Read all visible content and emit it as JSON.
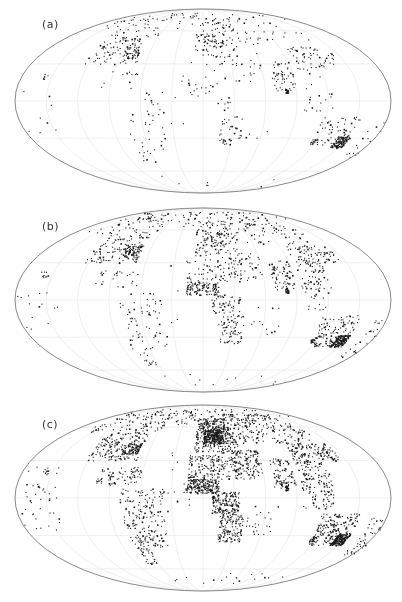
{
  "figure": {
    "projection": "Mollweide",
    "background": "#ffffff",
    "outline_color": "#8a8a8a",
    "graticule_color": "#e6e6e6",
    "dot_color": "#1a1a1a",
    "graticule": {
      "lon_step_deg": 30,
      "lat_step_deg": 30
    }
  },
  "panels": [
    {
      "label": "(a)",
      "top": 0,
      "height": 200,
      "center_x": 203,
      "center_y": 101,
      "rx": 188,
      "ry": 92,
      "label_x": 42,
      "label_y": 26,
      "density": 1.0
    },
    {
      "label": "(b)",
      "top": 200,
      "height": 200,
      "center_x": 203,
      "center_y": 100,
      "rx": 188,
      "ry": 92,
      "label_x": 42,
      "label_y": 28,
      "density": 1.6
    },
    {
      "label": "(c)",
      "top": 398,
      "height": 204,
      "center_x": 203,
      "center_y": 100,
      "rx": 188,
      "ry": 93,
      "label_x": 42,
      "label_y": 28,
      "density": 2.6
    }
  ],
  "station_regions": [
    {
      "name": "north-america",
      "lon": [
        -125,
        -70
      ],
      "lat": [
        30,
        55
      ],
      "a": 90,
      "b": 130,
      "c": 170
    },
    {
      "name": "canada-alaska",
      "lon": [
        -165,
        -60
      ],
      "lat": [
        55,
        75
      ],
      "a": 40,
      "b": 60,
      "c": 90
    },
    {
      "name": "us-east-dense",
      "lon": [
        -90,
        -72
      ],
      "lat": [
        35,
        45
      ],
      "a": 40,
      "b": 60,
      "c": 80
    },
    {
      "name": "central-america-caribbean",
      "lon": [
        -105,
        -62
      ],
      "lat": [
        10,
        25
      ],
      "a": 12,
      "b": 25,
      "c": 80
    },
    {
      "name": "south-america",
      "lon": [
        -80,
        -38
      ],
      "lat": [
        -40,
        8
      ],
      "a": 35,
      "b": 70,
      "c": 190
    },
    {
      "name": "south-america-south",
      "lon": [
        -75,
        -60
      ],
      "lat": [
        -55,
        -40
      ],
      "a": 10,
      "b": 15,
      "c": 30
    },
    {
      "name": "greenland-iceland",
      "lon": [
        -50,
        -15
      ],
      "lat": [
        62,
        80
      ],
      "a": 10,
      "b": 14,
      "c": 20
    },
    {
      "name": "europe",
      "lon": [
        -10,
        40
      ],
      "lat": [
        36,
        70
      ],
      "a": 80,
      "b": 110,
      "c": 320
    },
    {
      "name": "europe-core",
      "lon": [
        0,
        25
      ],
      "lat": [
        45,
        58
      ],
      "a": 20,
      "b": 30,
      "c": 260
    },
    {
      "name": "russia-north-asia",
      "lon": [
        40,
        140
      ],
      "lat": [
        45,
        75
      ],
      "a": 40,
      "b": 90,
      "c": 200
    },
    {
      "name": "middle-east",
      "lon": [
        30,
        60
      ],
      "lat": [
        15,
        40
      ],
      "a": 15,
      "b": 45,
      "c": 130
    },
    {
      "name": "north-africa",
      "lon": [
        -15,
        35
      ],
      "lat": [
        15,
        35
      ],
      "a": 12,
      "b": 60,
      "c": 160
    },
    {
      "name": "west-africa",
      "lon": [
        -17,
        15
      ],
      "lat": [
        4,
        15
      ],
      "a": 14,
      "b": 110,
      "c": 200
    },
    {
      "name": "central-africa",
      "lon": [
        8,
        35
      ],
      "lat": [
        -12,
        5
      ],
      "a": 10,
      "b": 50,
      "c": 170
    },
    {
      "name": "east-southern-africa",
      "lon": [
        15,
        40
      ],
      "lat": [
        -35,
        -12
      ],
      "a": 40,
      "b": 70,
      "c": 130
    },
    {
      "name": "india",
      "lon": [
        68,
        90
      ],
      "lat": [
        8,
        32
      ],
      "a": 50,
      "b": 70,
      "c": 90
    },
    {
      "name": "china-east-asia",
      "lon": [
        95,
        125
      ],
      "lat": [
        22,
        45
      ],
      "a": 40,
      "b": 80,
      "c": 110
    },
    {
      "name": "japan-korea",
      "lon": [
        125,
        145
      ],
      "lat": [
        30,
        45
      ],
      "a": 20,
      "b": 30,
      "c": 60
    },
    {
      "name": "southeast-asia",
      "lon": [
        95,
        125
      ],
      "lat": [
        -8,
        20
      ],
      "a": 18,
      "b": 50,
      "c": 110
    },
    {
      "name": "sri-lanka",
      "lon": [
        79,
        82
      ],
      "lat": [
        6,
        10
      ],
      "a": 25,
      "b": 25,
      "c": 25
    },
    {
      "name": "australia",
      "lon": [
        115,
        153
      ],
      "lat": [
        -38,
        -12
      ],
      "a": 60,
      "b": 120,
      "c": 190
    },
    {
      "name": "australia-southeast-dense",
      "lon": [
        140,
        153
      ],
      "lat": [
        -38,
        -28
      ],
      "a": 120,
      "b": 150,
      "c": 170
    },
    {
      "name": "australia-southwest",
      "lon": [
        114,
        120
      ],
      "lat": [
        -35,
        -30
      ],
      "a": 15,
      "b": 20,
      "c": 25
    },
    {
      "name": "new-zealand-pacific",
      "lon": [
        165,
        180
      ],
      "lat": [
        -47,
        -15
      ],
      "a": 15,
      "b": 25,
      "c": 45
    },
    {
      "name": "pacific-islands",
      "lon": [
        -180,
        -140
      ],
      "lat": [
        -25,
        25
      ],
      "a": 8,
      "b": 16,
      "c": 40
    },
    {
      "name": "hawaii",
      "lon": [
        -160,
        -154
      ],
      "lat": [
        18,
        23
      ],
      "a": 6,
      "b": 8,
      "c": 10
    },
    {
      "name": "atlantic-islands",
      "lon": [
        -35,
        -10
      ],
      "lat": [
        -20,
        40
      ],
      "a": 6,
      "b": 8,
      "c": 14
    },
    {
      "name": "antarctica-coast",
      "lon": [
        -70,
        170
      ],
      "lat": [
        -78,
        -64
      ],
      "a": 8,
      "b": 10,
      "c": 18
    },
    {
      "name": "arctic-coast",
      "lon": [
        -180,
        180
      ],
      "lat": [
        72,
        82
      ],
      "a": 30,
      "b": 40,
      "c": 60
    },
    {
      "name": "madagascar-indian-ocean",
      "lon": [
        43,
        75
      ],
      "lat": [
        -30,
        -5
      ],
      "a": 5,
      "b": 12,
      "c": 25
    }
  ]
}
